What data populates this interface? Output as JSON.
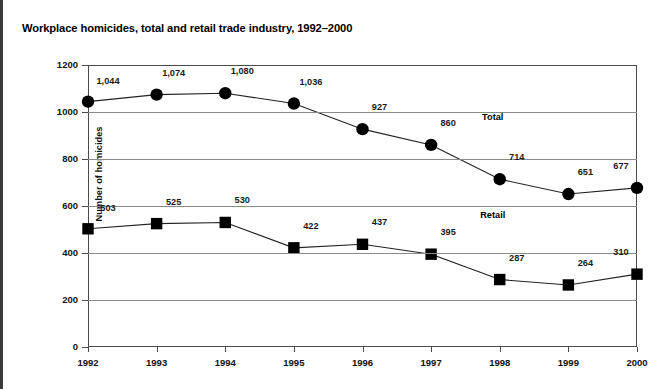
{
  "page": {
    "title": "Workplace homicides, total and retail trade industry, 1992–2000"
  },
  "chart_data": {
    "type": "line",
    "title": "Workplace homicides, total and retail trade industry, 1992–2000",
    "xlabel": "",
    "ylabel": "Number of homicides",
    "categories": [
      "1992",
      "1993",
      "1994",
      "1995",
      "1996",
      "1997",
      "1998",
      "1999",
      "2000"
    ],
    "x": [
      1992,
      1993,
      1994,
      1995,
      1996,
      1997,
      1998,
      1999,
      2000
    ],
    "xlim": [
      1992,
      2000
    ],
    "ylim": [
      0,
      1200
    ],
    "yticks": [
      0,
      200,
      400,
      600,
      800,
      1000,
      1200
    ],
    "ytick_labels": [
      "0",
      "200",
      "400",
      "600",
      "800",
      "1000",
      "1200"
    ],
    "grid": "horizontal",
    "legend": "inline-series-labels",
    "series": [
      {
        "name": "Total",
        "marker": "circle",
        "values": [
          1044,
          1074,
          1080,
          1036,
          927,
          860,
          714,
          651,
          677
        ],
        "value_labels": [
          "1,044",
          "1,074",
          "1,080",
          "1,036",
          "927",
          "860",
          "714",
          "651",
          "677"
        ]
      },
      {
        "name": "Retail",
        "marker": "square",
        "values": [
          503,
          525,
          530,
          422,
          437,
          395,
          287,
          264,
          310
        ],
        "value_labels": [
          "503",
          "525",
          "530",
          "422",
          "437",
          "395",
          "287",
          "264",
          "310"
        ]
      }
    ],
    "colors": {
      "series_line": "#222222",
      "marker": "#000000",
      "gridline": "#8a8a8a",
      "axis": "#4a4a4a",
      "background": "#ffffff"
    }
  }
}
